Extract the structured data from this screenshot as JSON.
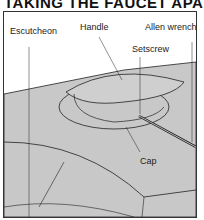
{
  "title": "TAKING THE FAUCET APART",
  "labels": {
    "escutcheon": "Escutcheon",
    "handle": "Handle",
    "allen_wrench": "Allen wrench",
    "setscrew": "Setscrew",
    "cap": "Cap"
  },
  "colors": {
    "fill": "#c8c8c8",
    "line": "#222222"
  }
}
